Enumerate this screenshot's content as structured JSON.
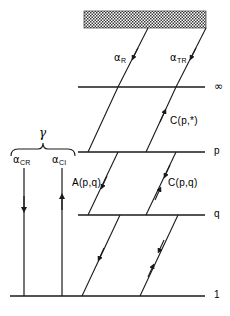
{
  "figure": {
    "background_color": "#ffffff",
    "line_color": "#1a1a1a",
    "continuum_label": "continuum-hatched-block"
  },
  "levels": [
    {
      "id": "continuum",
      "label": "",
      "y": 22
    },
    {
      "id": "infinity",
      "label": "∞",
      "y": 87
    },
    {
      "id": "p",
      "label": "p",
      "y": 152
    },
    {
      "id": "q",
      "label": "q",
      "y": 215
    },
    {
      "id": "one",
      "label": "1",
      "y": 296
    }
  ],
  "rates": [
    {
      "id": "alpha-R",
      "symbol": "α",
      "subscript": "R",
      "direction": "down"
    },
    {
      "id": "alpha-TR",
      "symbol": "α",
      "subscript": "TR",
      "direction": "down"
    },
    {
      "id": "alpha-CR",
      "symbol": "α",
      "subscript": "CR",
      "direction": "down"
    },
    {
      "id": "alpha-CI",
      "symbol": "α",
      "subscript": "CI",
      "direction": "up"
    }
  ],
  "collision_labels": [
    {
      "id": "c-p-star",
      "text": "C(p,*)",
      "direction": "up"
    },
    {
      "id": "a-p-q",
      "text": "A(p,q)",
      "direction": "down"
    },
    {
      "id": "c-p-q",
      "text": "C(p,q)",
      "direction": "both"
    }
  ],
  "brace": {
    "id": "gamma-brace",
    "label": "γ"
  }
}
